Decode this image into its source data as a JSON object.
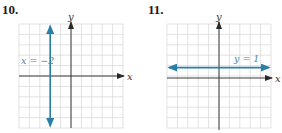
{
  "graphs": [
    {
      "number": "10.",
      "x_axis_label": "x",
      "y_axis_label": "y",
      "line_label": "x = −2",
      "line": {
        "type": "vertical",
        "equation": "x = -2",
        "value": -2
      }
    },
    {
      "number": "11.",
      "x_axis_label": "x",
      "y_axis_label": "y",
      "line_label": "y = 1",
      "line": {
        "type": "horizontal",
        "equation": "y = 1",
        "value": 1
      }
    }
  ],
  "colors": {
    "line": "#2a7fa8",
    "grid": "#d9d9d9",
    "axis": "#3a3a3a",
    "label": "#4a86a8"
  }
}
